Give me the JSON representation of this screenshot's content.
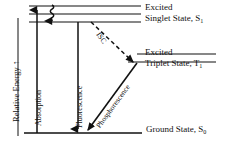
{
  "figure": {
    "type": "jablonski-energy-level-diagram",
    "axis": {
      "ylabel": "Relative Energy",
      "arrow_glyph": "↑"
    },
    "states": [
      {
        "id": "excited-singlet",
        "line1": "Excited",
        "line2": "Singlet State, S",
        "sub": "1",
        "levels": 3
      },
      {
        "id": "excited-triplet",
        "line1": "Excited",
        "line2": "Triplet State, T",
        "sub": "1",
        "levels": 2
      },
      {
        "id": "ground-singlet",
        "line1": "Ground State, S",
        "sub": "0",
        "levels": 1
      }
    ],
    "transitions": [
      {
        "id": "absorption",
        "label": "Absorption",
        "style": "solid-up"
      },
      {
        "id": "vibrational-relax",
        "label": "",
        "style": "wavy-down"
      },
      {
        "id": "fluorescence",
        "label": "Fluorescence",
        "style": "solid-down"
      },
      {
        "id": "isc",
        "label": "ISC",
        "style": "dashed-diagonal"
      },
      {
        "id": "phosphorescence",
        "label": "Phosphorescence",
        "style": "solid-diagonal"
      }
    ],
    "colors": {
      "ink": "#111111",
      "background": "#ffffff"
    }
  }
}
